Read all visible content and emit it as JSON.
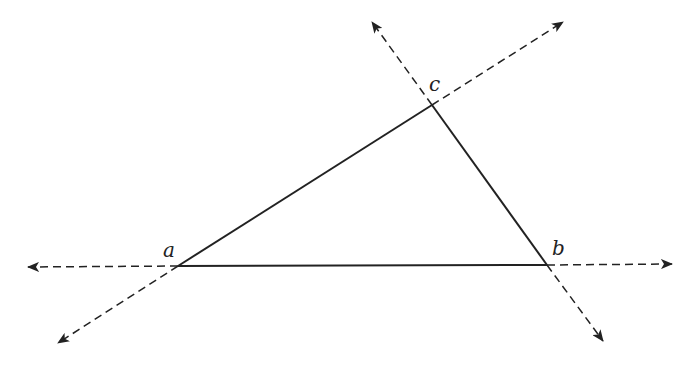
{
  "diagram": {
    "type": "triangle-with-extended-sides",
    "colors": {
      "stroke": "#222222",
      "background": "#ffffff"
    },
    "vertices": [
      {
        "id": "a",
        "label": "a",
        "x": 178,
        "y": 266,
        "label_x": 163,
        "label_y": 240
      },
      {
        "id": "b",
        "label": "b",
        "x": 547,
        "y": 265,
        "label_x": 552,
        "label_y": 238
      },
      {
        "id": "c",
        "label": "c",
        "x": 432,
        "y": 105,
        "label_x": 429,
        "label_y": 74
      }
    ],
    "sides": [
      {
        "from": "a",
        "to": "b",
        "style": "solid"
      },
      {
        "from": "b",
        "to": "c",
        "style": "solid"
      },
      {
        "from": "c",
        "to": "a",
        "style": "solid"
      }
    ],
    "extensions": [
      {
        "from": "a",
        "to_x": 28,
        "to_y": 267,
        "style": "dashed-arrow",
        "line": "ab"
      },
      {
        "from": "b",
        "to_x": 672,
        "to_y": 264,
        "style": "dashed-arrow",
        "line": "ab"
      },
      {
        "from": "a",
        "to_x": 58,
        "to_y": 343,
        "style": "dashed-arrow",
        "line": "ac"
      },
      {
        "from": "c",
        "to_x": 563,
        "to_y": 22,
        "style": "dashed-arrow",
        "line": "ac"
      },
      {
        "from": "c",
        "to_x": 372,
        "to_y": 22,
        "style": "dashed-arrow",
        "line": "bc"
      },
      {
        "from": "b",
        "to_x": 603,
        "to_y": 341,
        "style": "dashed-arrow",
        "line": "bc"
      }
    ]
  }
}
